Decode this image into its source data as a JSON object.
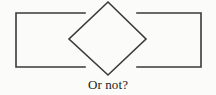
{
  "figure": {
    "caption": "Or not?",
    "background_color": "#fbfbfa",
    "stroke_color": "#3a3a3a",
    "stroke_width": 1.6,
    "shapes": [
      {
        "name": "left-rectangle",
        "type": "rectangle-open-right",
        "x": 16,
        "y": 13,
        "width": 69,
        "height": 54,
        "note": "Right side occluded by diamond; drawn as open C opening rightward"
      },
      {
        "name": "right-rectangle",
        "type": "rectangle-open-left",
        "x": 137,
        "y": 13,
        "width": 64,
        "height": 54,
        "note": "Left side occluded by diamond; drawn as open C opening leftward"
      },
      {
        "name": "center-diamond",
        "type": "diamond",
        "top": [
          108,
          2
        ],
        "right": [
          146,
          39
        ],
        "bottom": [
          108,
          75
        ],
        "left": [
          69,
          39
        ]
      }
    ],
    "geometry": {
      "left_rect_top_edge": "16,13 to 85,13",
      "left_rect_bottom_edge": "16,67 to 85,67",
      "left_rect_left_edge": "16,13 to 16,67",
      "right_rect_top_edge": "137,13 to 201,13",
      "right_rect_bottom_edge": "137,67 to 201,67",
      "right_rect_right_edge": "201,13 to 201,67",
      "diamond_path": "M108,2 L146,39 L108,75 L69,39 Z"
    }
  }
}
